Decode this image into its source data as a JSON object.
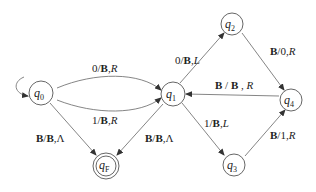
{
  "diagram": {
    "type": "turing-machine-state-diagram",
    "states": [
      {
        "id": "q0",
        "label": "q",
        "sub": "0",
        "x": 41,
        "y": 93,
        "initial": true,
        "accepting": false
      },
      {
        "id": "q1",
        "label": "q",
        "sub": "1",
        "x": 173,
        "y": 94,
        "initial": false,
        "accepting": false
      },
      {
        "id": "q2",
        "label": "q",
        "sub": "2",
        "x": 232,
        "y": 24,
        "initial": false,
        "accepting": false
      },
      {
        "id": "q3",
        "label": "q",
        "sub": "3",
        "x": 234,
        "y": 165,
        "initial": false,
        "accepting": false
      },
      {
        "id": "q4",
        "label": "q",
        "sub": "4",
        "x": 291,
        "y": 100,
        "initial": false,
        "accepting": false
      },
      {
        "id": "qF",
        "label": "q",
        "sub": "F",
        "x": 106,
        "y": 166,
        "initial": false,
        "accepting": true
      }
    ],
    "transitions": [
      {
        "from": "q0",
        "to": "q1",
        "label": "0/B,R"
      },
      {
        "from": "q0",
        "to": "q1",
        "label": "1/B,R"
      },
      {
        "from": "q0",
        "to": "qF",
        "label": "B/B,Λ"
      },
      {
        "from": "q1",
        "to": "qF",
        "label": "B/B,Λ"
      },
      {
        "from": "q1",
        "to": "q2",
        "label": "0/B,L"
      },
      {
        "from": "q1",
        "to": "q3",
        "label": "1/B,L"
      },
      {
        "from": "q2",
        "to": "q4",
        "label": "B/0,R"
      },
      {
        "from": "q3",
        "to": "q4",
        "label": "B/1,R"
      },
      {
        "from": "q4",
        "to": "q1",
        "label": "B / B , R"
      }
    ]
  }
}
